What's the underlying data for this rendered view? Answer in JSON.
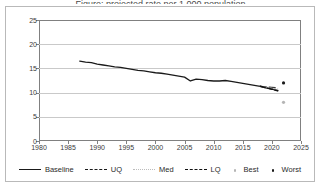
{
  "figure": {
    "title_remnant": "Figure: projected rate per 1,000 population",
    "background": "#ffffff",
    "border_color": "#b9b9b9"
  },
  "chart_data": {
    "type": "line",
    "title": "",
    "xlabel": "",
    "ylabel": "",
    "xlim": [
      1980,
      2025
    ],
    "ylim": [
      0,
      25
    ],
    "xticks": [
      1980,
      1985,
      1990,
      1995,
      2000,
      2005,
      2010,
      2015,
      2020,
      2025
    ],
    "yticks": [
      0,
      5,
      10,
      15,
      20,
      25
    ],
    "grid": "horizontal",
    "legend_position": "bottom",
    "series": [
      {
        "name": "Baseline",
        "style": "solid",
        "color": "#1a1a1a",
        "x": [
          1987,
          1988,
          1989,
          1990,
          1991,
          1992,
          1993,
          1994,
          1995,
          1996,
          1997,
          1998,
          1999,
          2000,
          2001,
          2002,
          2003,
          2004,
          2005,
          2006,
          2007,
          2008,
          2009,
          2010,
          2011,
          2012,
          2013,
          2014,
          2015,
          2016,
          2017,
          2018,
          2019,
          2020,
          2021
        ],
        "values": [
          16.5,
          16.3,
          16.2,
          15.9,
          15.7,
          15.5,
          15.3,
          15.2,
          15.0,
          14.8,
          14.6,
          14.5,
          14.3,
          14.1,
          14.0,
          13.8,
          13.6,
          13.4,
          13.2,
          12.4,
          12.8,
          12.7,
          12.5,
          12.4,
          12.4,
          12.5,
          12.3,
          12.1,
          11.9,
          11.7,
          11.5,
          11.3,
          11.0,
          10.7,
          10.4
        ]
      },
      {
        "name": "UQ",
        "style": "long-dash",
        "color": "#3a3a3a",
        "x": [
          2018,
          2019,
          2020,
          2021
        ],
        "values": [
          11.3,
          11.2,
          11.1,
          11.0
        ]
      },
      {
        "name": "Med",
        "style": "dotted",
        "color": "#bcbcbc",
        "x": [
          2018,
          2019,
          2020,
          2021
        ],
        "values": [
          11.3,
          11.1,
          10.9,
          10.7
        ]
      },
      {
        "name": "LQ",
        "style": "dash-dot",
        "color": "#111111",
        "x": [
          2018,
          2019,
          2020,
          2021
        ],
        "values": [
          11.3,
          11.0,
          10.7,
          10.4
        ]
      }
    ],
    "point_markers": [
      {
        "name": "Worst",
        "x": 2022,
        "y": 12.0,
        "color": "#1a1a1a",
        "marker": "dot"
      },
      {
        "name": "Best",
        "x": 2022,
        "y": 8.0,
        "color": "#b5b5b5",
        "marker": "dot"
      }
    ]
  },
  "legend": {
    "items": [
      {
        "label": "Baseline",
        "swatch": "solid-line"
      },
      {
        "label": "UQ",
        "swatch": "long-dash-line"
      },
      {
        "label": "Med",
        "swatch": "dotted-line"
      },
      {
        "label": "LQ",
        "swatch": "dash-dot-line"
      },
      {
        "label": "Best",
        "swatch": "light-dot-marker"
      },
      {
        "label": "Worst",
        "swatch": "dark-dot-marker"
      }
    ]
  }
}
